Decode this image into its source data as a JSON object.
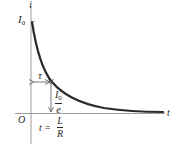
{
  "diagram": {
    "colors": {
      "axis": "#9a9a9a",
      "curve": "#2b2b2b",
      "arrow": "#555555",
      "text": "#2a2a2a"
    },
    "axes": {
      "y_label": "i",
      "x_label": "t",
      "origin_label": "O"
    },
    "labels": {
      "initial_current": {
        "main": "I",
        "sub": "0"
      },
      "tau": "τ",
      "decayed_current": {
        "numerator_main": "I",
        "numerator_sub": "0",
        "denominator": "e"
      },
      "time_constant": {
        "lhs": "t =",
        "numerator": "L",
        "denominator": "R"
      }
    },
    "curve": {
      "equation": "i = I0 * exp(-t/τ)",
      "description": "exponential decay of current from I0 toward zero"
    }
  }
}
